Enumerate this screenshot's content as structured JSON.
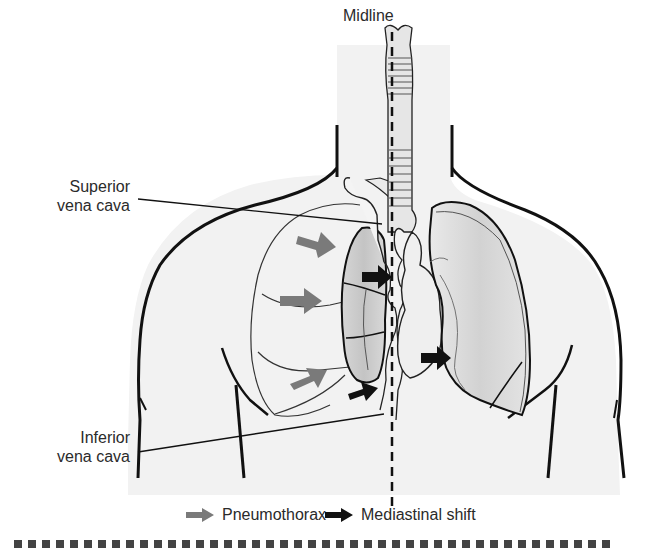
{
  "figure": {
    "labels": {
      "midline": "Midline",
      "superior_vena_cava_line1": "Superior",
      "superior_vena_cava_line2": "vena cava",
      "inferior_vena_cava_line1": "Inferior",
      "inferior_vena_cava_line2": "vena cava"
    },
    "legend": [
      {
        "key": "pneumothorax",
        "label": "Pneumothorax",
        "arrow_color": "#7a7a7a"
      },
      {
        "key": "mediastinal_shift",
        "label": "Mediastinal shift",
        "arrow_color": "#111111"
      }
    ],
    "caption_truncated": "FIG. ...",
    "colors": {
      "outline": "#111111",
      "body_fill": "#f2f2f2",
      "lung_fill": "#dcdcdc",
      "collapsed_lung_fill": "#cfcfcf",
      "trachea_fill": "#e6e6e6",
      "pneumo_arrow": "#7a7a7a",
      "shift_arrow": "#111111",
      "text": "#2b2b2b"
    }
  }
}
